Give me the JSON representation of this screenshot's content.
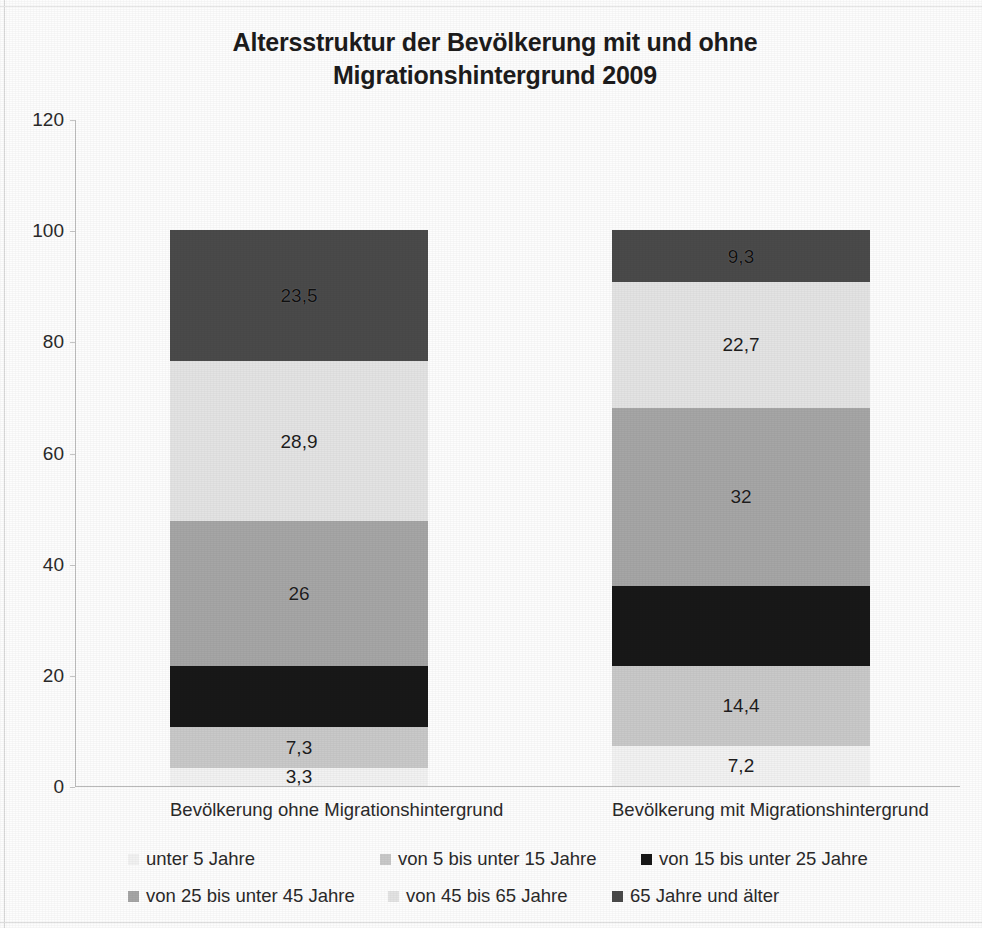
{
  "chart_data": {
    "type": "bar",
    "stacked": true,
    "orientation": "vertical",
    "title": "Altersstruktur der Bevölkerung mit und ohne Migrationshintergrund 2009",
    "title_lines": [
      "Altersstruktur der Bevölkerung mit und ohne",
      "Migrationshintergrund 2009"
    ],
    "xlabel": "",
    "ylabel": "",
    "ylim": [
      0,
      120
    ],
    "yticks": [
      0,
      20,
      40,
      60,
      80,
      100,
      120
    ],
    "ytick_labels": [
      "0",
      "20",
      "40",
      "60",
      "80",
      "100",
      "120"
    ],
    "grid": false,
    "legend_position": "bottom",
    "categories": [
      "Bevölkerung ohne Migrationshintergrund",
      "Bevölkerung mit Migrationshintergrund"
    ],
    "series": [
      {
        "name": "unter 5 Jahre",
        "color": "#f2f2f2",
        "values": [
          3.3,
          7.2
        ],
        "labels": [
          "3,3",
          "7,2"
        ]
      },
      {
        "name": "von 5 bis unter 15 Jahre",
        "color": "#c9c9c9",
        "values": [
          7.3,
          14.4
        ],
        "labels": [
          "7,3",
          "14,4"
        ]
      },
      {
        "name": "von 15 bis unter 25 Jahre",
        "color": "#181818",
        "values": [
          11.0,
          14.4
        ],
        "labels": [
          "",
          ""
        ]
      },
      {
        "name": "von 25 bis unter 45 Jahre",
        "color": "#a6a6a6",
        "values": [
          26,
          32
        ],
        "labels": [
          "26",
          "32"
        ]
      },
      {
        "name": "von 45 bis 65 Jahre",
        "color": "#e3e3e3",
        "values": [
          28.9,
          22.7
        ],
        "labels": [
          "28,9",
          "22,7"
        ]
      },
      {
        "name": "65 Jahre und älter",
        "color": "#4a4a4a",
        "values": [
          23.5,
          9.3
        ],
        "labels": [
          "23,5",
          "9,3"
        ]
      }
    ],
    "legend_entries": [
      "unter 5 Jahre",
      "von 5 bis unter 15 Jahre",
      "von 15 bis unter 25 Jahre",
      "von 25 bis unter 45 Jahre",
      "von 45 bis 65 Jahre",
      "65 Jahre und älter"
    ]
  }
}
